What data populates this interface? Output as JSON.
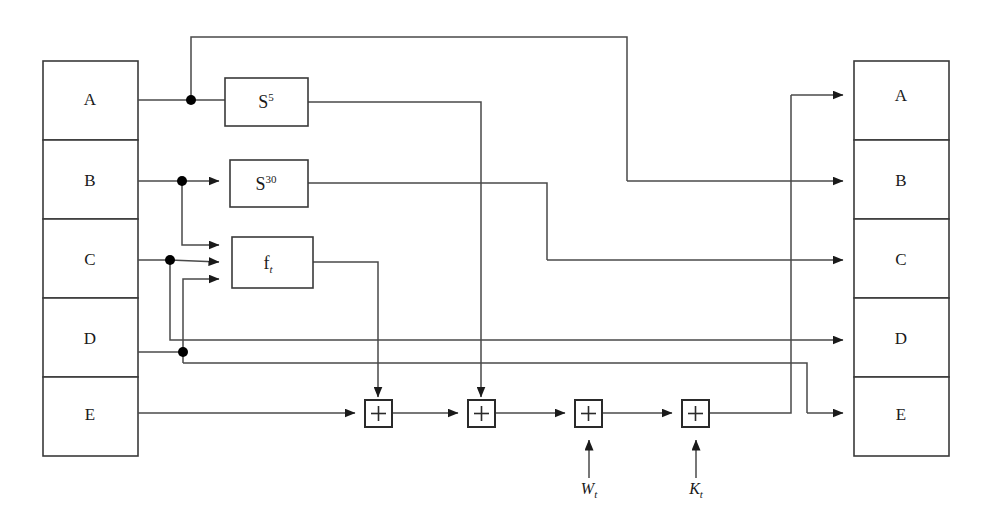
{
  "diagram": {
    "left_register": {
      "name": "input-register-stack",
      "x": 43,
      "y": 61,
      "width": 95,
      "cell_height": 79,
      "cells": [
        {
          "label": "A",
          "row": 0
        },
        {
          "label": "B",
          "row": 1
        },
        {
          "label": "C",
          "row": 2
        },
        {
          "label": "D",
          "row": 3
        },
        {
          "label": "E",
          "row": 4
        }
      ]
    },
    "right_register": {
      "name": "output-register-stack",
      "x": 854,
      "y": 61,
      "width": 95,
      "cell_height": 79,
      "cells": [
        {
          "label": "A",
          "row": 0
        },
        {
          "label": "B",
          "row": 1
        },
        {
          "label": "C",
          "row": 2
        },
        {
          "label": "D",
          "row": 3
        },
        {
          "label": "E",
          "row": 4
        }
      ]
    },
    "function_blocks": [
      {
        "id": "shift5",
        "label_base": "S",
        "label_sup": "5",
        "x": 225,
        "y": 78,
        "w": 83,
        "h": 48,
        "inputs": 1
      },
      {
        "id": "shift30",
        "label_base": "S",
        "label_sup": "30",
        "x": 230,
        "y": 160,
        "w": 78,
        "h": 47,
        "inputs": 1
      },
      {
        "id": "ft",
        "label_base": "f",
        "label_sub": "t",
        "x": 232,
        "y": 237,
        "w": 81,
        "h": 51,
        "inputs": 3
      }
    ],
    "adders": [
      {
        "id": "add1",
        "label": "+",
        "x": 365,
        "y": 400,
        "size": 27
      },
      {
        "id": "add2",
        "label": "+",
        "x": 468,
        "y": 400,
        "size": 27
      },
      {
        "id": "add3",
        "label": "+",
        "x": 575,
        "y": 400,
        "size": 27
      },
      {
        "id": "add4",
        "label": "+",
        "x": 682,
        "y": 400,
        "size": 27
      }
    ],
    "external_inputs": [
      {
        "id": "wt",
        "base": "W",
        "sub": "t",
        "x": 589,
        "y": 494
      },
      {
        "id": "kt",
        "base": "K",
        "sub": "t",
        "x": 696,
        "y": 494
      }
    ],
    "junction_dots": [
      {
        "id": "dot-a",
        "x": 191,
        "y": 100
      },
      {
        "id": "dot-b",
        "x": 182,
        "y": 181
      },
      {
        "id": "dot-c",
        "x": 170,
        "y": 260
      },
      {
        "id": "dot-d",
        "x": 183,
        "y": 352
      }
    ],
    "colors": {
      "background": "#ffffff",
      "wire": "#4a4a4a",
      "box_stroke": "#3a3a3a",
      "text": "#1a1a1a",
      "dot": "#000000"
    }
  }
}
